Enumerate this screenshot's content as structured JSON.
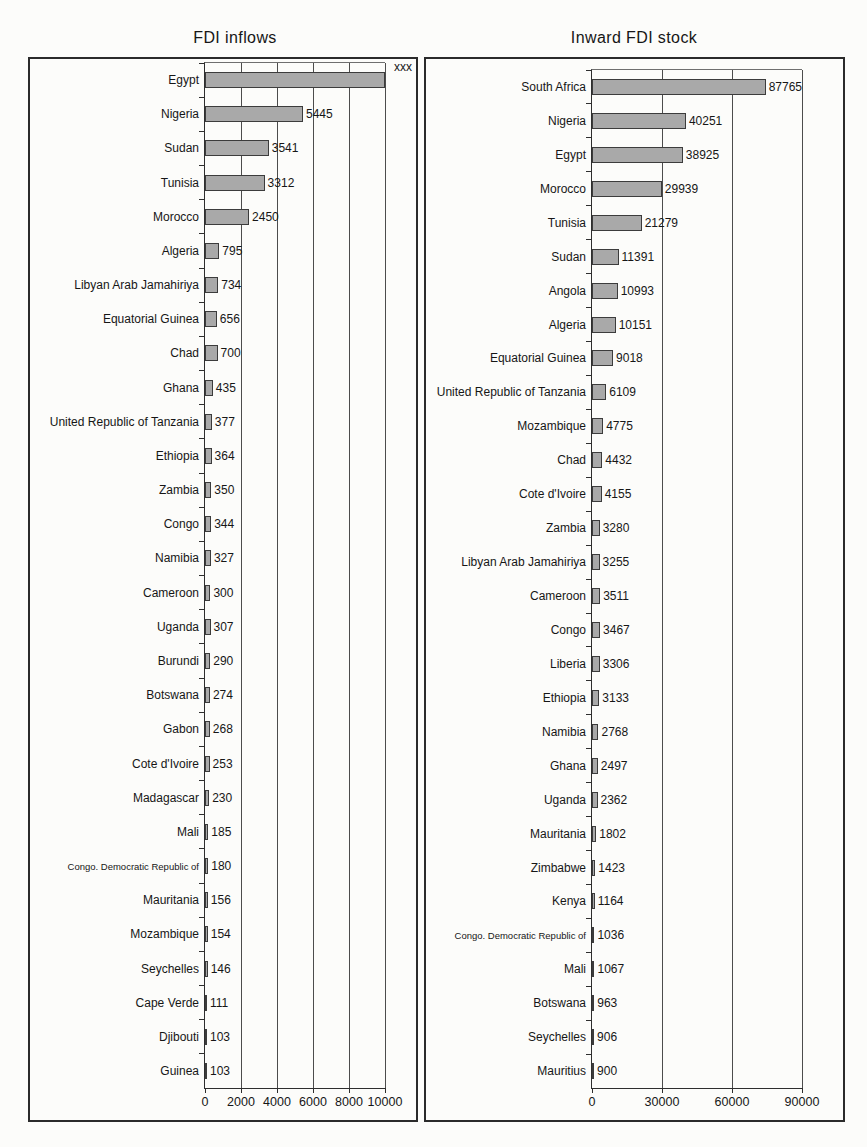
{
  "figure": {
    "kind": "scanned two-panel horizontal bar chart"
  },
  "colors": {
    "background": "#fcfcfa",
    "bar_fill": "#a9a9a9",
    "bar_border": "#3c3c3c",
    "frame": "#2b2b2b",
    "text": "#161616"
  },
  "chart_data": [
    {
      "type": "bar",
      "orientation": "horizontal",
      "title": "FDI inflows",
      "xlabel": "",
      "ylabel": "",
      "xlim": [
        0,
        10000
      ],
      "x_ticks": [
        0,
        2000,
        4000,
        6000,
        8000,
        10000
      ],
      "grid": true,
      "legend": "none",
      "bars": [
        {
          "label": "Egypt",
          "value": 10400,
          "value_label": "xxx",
          "value_label_corner": true
        },
        {
          "label": "Nigeria",
          "value": 5445,
          "value_label": "5445"
        },
        {
          "label": "Sudan",
          "value": 3541,
          "value_label": "3541"
        },
        {
          "label": "Tunisia",
          "value": 3312,
          "value_label": "3312"
        },
        {
          "label": "Morocco",
          "value": 2450,
          "value_label": "2450"
        },
        {
          "label": "Algeria",
          "value": 795,
          "value_label": "795"
        },
        {
          "label": "Libyan Arab Jamahiriya",
          "value": 734,
          "value_label": "734"
        },
        {
          "label": "Equatorial Guinea",
          "value": 656,
          "value_label": "656"
        },
        {
          "label": "Chad",
          "value": 700,
          "value_label": "700"
        },
        {
          "label": "Ghana",
          "value": 435,
          "value_label": "435"
        },
        {
          "label": "United Republic of Tanzania",
          "value": 377,
          "value_label": "377"
        },
        {
          "label": "Ethiopia",
          "value": 364,
          "value_label": "364"
        },
        {
          "label": "Zambia",
          "value": 350,
          "value_label": "350"
        },
        {
          "label": "Congo",
          "value": 344,
          "value_label": "344"
        },
        {
          "label": "Namibia",
          "value": 327,
          "value_label": "327"
        },
        {
          "label": "Cameroon",
          "value": 300,
          "value_label": "300"
        },
        {
          "label": "Uganda",
          "value": 307,
          "value_label": "307"
        },
        {
          "label": "Burundi",
          "value": 290,
          "value_label": "290"
        },
        {
          "label": "Botswana",
          "value": 274,
          "value_label": "274"
        },
        {
          "label": "Gabon",
          "value": 268,
          "value_label": "268"
        },
        {
          "label": "Cote d'Ivoire",
          "value": 253,
          "value_label": "253"
        },
        {
          "label": "Madagascar",
          "value": 230,
          "value_label": "230"
        },
        {
          "label": "Mali",
          "value": 185,
          "value_label": "185"
        },
        {
          "label": "Congo. Democratic Republic of",
          "value": 180,
          "value_label": "180",
          "small_label": true
        },
        {
          "label": "Mauritania",
          "value": 156,
          "value_label": "156"
        },
        {
          "label": "Mozambique",
          "value": 154,
          "value_label": "154"
        },
        {
          "label": "Seychelles",
          "value": 146,
          "value_label": "146"
        },
        {
          "label": "Cape Verde",
          "value": 111,
          "value_label": "111"
        },
        {
          "label": "Djibouti",
          "value": 103,
          "value_label": "103"
        },
        {
          "label": "Guinea",
          "value": 103,
          "value_label": "103"
        }
      ]
    },
    {
      "type": "bar",
      "orientation": "horizontal",
      "title": "Inward FDI stock",
      "xlabel": "",
      "ylabel": "",
      "xlim": [
        0,
        90000
      ],
      "x_ticks": [
        0,
        30000,
        60000,
        90000
      ],
      "grid": true,
      "legend": "none",
      "bars": [
        {
          "label": "South Africa",
          "value": 87765,
          "value_label": "87765"
        },
        {
          "label": "Nigeria",
          "value": 40251,
          "value_label": "40251"
        },
        {
          "label": "Egypt",
          "value": 38925,
          "value_label": "38925"
        },
        {
          "label": "Morocco",
          "value": 29939,
          "value_label": "29939"
        },
        {
          "label": "Tunisia",
          "value": 21279,
          "value_label": "21279"
        },
        {
          "label": "Sudan",
          "value": 11391,
          "value_label": "11391"
        },
        {
          "label": "Angola",
          "value": 10993,
          "value_label": "10993"
        },
        {
          "label": "Algeria",
          "value": 10151,
          "value_label": "10151"
        },
        {
          "label": "Equatorial Guinea",
          "value": 9018,
          "value_label": "9018"
        },
        {
          "label": "United Republic of Tanzania",
          "value": 6109,
          "value_label": "6109"
        },
        {
          "label": "Mozambique",
          "value": 4775,
          "value_label": "4775"
        },
        {
          "label": "Chad",
          "value": 4432,
          "value_label": "4432"
        },
        {
          "label": "Cote d'Ivoire",
          "value": 4155,
          "value_label": "4155"
        },
        {
          "label": "Zambia",
          "value": 3280,
          "value_label": "3280"
        },
        {
          "label": "Libyan Arab Jamahiriya",
          "value": 3255,
          "value_label": "3255"
        },
        {
          "label": "Cameroon",
          "value": 3511,
          "value_label": "3511"
        },
        {
          "label": "Congo",
          "value": 3467,
          "value_label": "3467"
        },
        {
          "label": "Liberia",
          "value": 3306,
          "value_label": "3306"
        },
        {
          "label": "Ethiopia",
          "value": 3133,
          "value_label": "3133"
        },
        {
          "label": "Namibia",
          "value": 2768,
          "value_label": "2768"
        },
        {
          "label": "Ghana",
          "value": 2497,
          "value_label": "2497"
        },
        {
          "label": "Uganda",
          "value": 2362,
          "value_label": "2362"
        },
        {
          "label": "Mauritania",
          "value": 1802,
          "value_label": "1802"
        },
        {
          "label": "Zimbabwe",
          "value": 1423,
          "value_label": "1423"
        },
        {
          "label": "Kenya",
          "value": 1164,
          "value_label": "1164"
        },
        {
          "label": "Congo. Democratic Republic of",
          "value": 1036,
          "value_label": "1036",
          "small_label": true
        },
        {
          "label": "Mali",
          "value": 1067,
          "value_label": "1067"
        },
        {
          "label": "Botswana",
          "value": 963,
          "value_label": "963"
        },
        {
          "label": "Seychelles",
          "value": 906,
          "value_label": "906"
        },
        {
          "label": "Mauritius",
          "value": 900,
          "value_label": "900"
        }
      ]
    }
  ]
}
